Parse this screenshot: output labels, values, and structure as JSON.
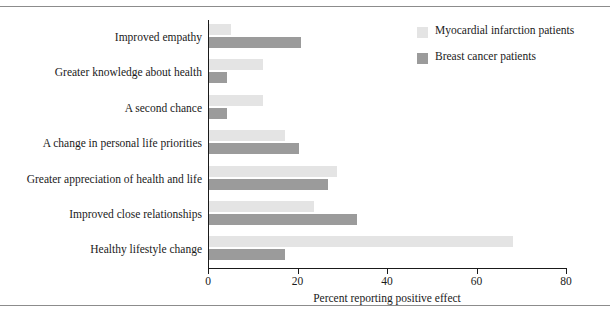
{
  "chart_data": {
    "type": "bar",
    "orientation": "horizontal",
    "title": "",
    "xlabel": "Percent reporting positive effect",
    "ylabel": "",
    "xlim": [
      0,
      80
    ],
    "xticks": [
      0,
      20,
      40,
      60,
      80
    ],
    "xtick_labels": [
      "0",
      "20",
      "40",
      "60",
      "80"
    ],
    "grid": false,
    "legend_position": "top-right",
    "categories": [
      "Improved empathy",
      "Greater knowledge about health",
      "A second chance",
      "A change in personal life priorities",
      "Greater appreciation of health and life",
      "Improved close relationships",
      "Healthy lifestyle change"
    ],
    "series": [
      {
        "name": "Myocardial infarction patients",
        "color": "#e4e4e4",
        "values": [
          5,
          12,
          12,
          17,
          28.5,
          23.5,
          68
        ]
      },
      {
        "name": "Breast cancer patients",
        "color": "#9b9b9b",
        "values": [
          20.5,
          4,
          4,
          20,
          26.5,
          33,
          17
        ]
      }
    ]
  },
  "legend": {
    "items": [
      {
        "label": "Myocardial infarction patients",
        "swatch": "light"
      },
      {
        "label": "Breast cancer patients",
        "swatch": "dark"
      }
    ]
  },
  "axis": {
    "x_title": "Percent reporting positive effect"
  },
  "colors": {
    "light_series": "#e4e4e4",
    "dark_series": "#9b9b9b",
    "axis": "#1a1a1a",
    "rule": "#8c8c8c"
  }
}
